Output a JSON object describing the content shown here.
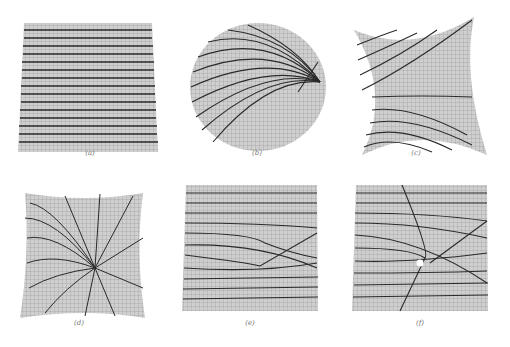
{
  "figure": {
    "panels": [
      {
        "id": "a",
        "caption": "(a)",
        "description": "flat square grid with parallel horizontal lines"
      },
      {
        "id": "b",
        "caption": "(b)",
        "description": "disk-shaped surface with curves converging to a point on the right"
      },
      {
        "id": "c",
        "caption": "(c)",
        "description": "saddle-like cross-shaped surface with curved lines"
      },
      {
        "id": "d",
        "caption": "(d)",
        "description": "concave square surface with lines radiating from a central singular point"
      },
      {
        "id": "e",
        "caption": "(e)",
        "description": "square grid with lines deflected around a bump, two crossing lines"
      },
      {
        "id": "f",
        "caption": "(f)",
        "description": "square grid with a hole (white dot) and lines bending around it"
      }
    ]
  },
  "colors": {
    "grid_fill": "#cfcfcf",
    "grid_line": "#8a8a8a",
    "curve": "#2a2a2a",
    "caption": "#777777"
  }
}
